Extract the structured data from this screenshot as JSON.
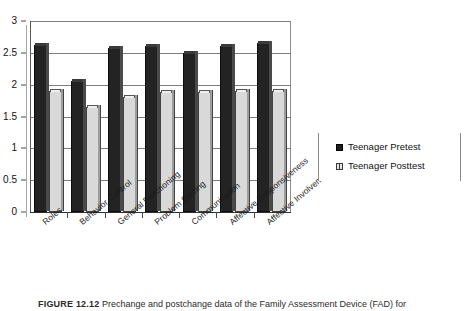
{
  "figure": {
    "caption_label": "FIGURE 12.12",
    "caption_text": "Prechange and postchange data of the Family Assessment Device (FAD) for"
  },
  "legend": {
    "position": "right",
    "entries": [
      {
        "label": "Teenager Pretest",
        "marker": "filled-square-icon",
        "color": "#232323"
      },
      {
        "label": "Teenager Posttest",
        "marker": "hollow-square-icon",
        "color": "#d9d9d9"
      }
    ]
  },
  "axes": {
    "y_ticks": [
      "0",
      "0.5",
      "1",
      "1.5",
      "2",
      "2.5",
      "3"
    ],
    "y_min": 0,
    "y_max": 3,
    "y_label": "",
    "x_label": "",
    "grid": true
  },
  "chart_data": {
    "type": "bar",
    "title": "",
    "subtitle": "",
    "xlabel": "",
    "ylabel": "",
    "ylim": [
      0,
      3
    ],
    "ytick_values": [
      0,
      0.5,
      1,
      1.5,
      2,
      2.5,
      3
    ],
    "grid": true,
    "legend_position": "right",
    "categories": [
      "Roles",
      "Behavior Control",
      "General Functioning",
      "Problem Solving",
      "Communication",
      "Affective Responsiveness",
      "Affective Involvement"
    ],
    "series": [
      {
        "name": "Teenager Pretest",
        "color": "#232323",
        "values": [
          2.62,
          2.05,
          2.58,
          2.6,
          2.5,
          2.6,
          2.65
        ]
      },
      {
        "name": "Teenager Posttest",
        "color": "#d9d9d9",
        "values": [
          1.9,
          1.65,
          1.8,
          1.88,
          1.88,
          1.9,
          1.9
        ]
      }
    ]
  }
}
